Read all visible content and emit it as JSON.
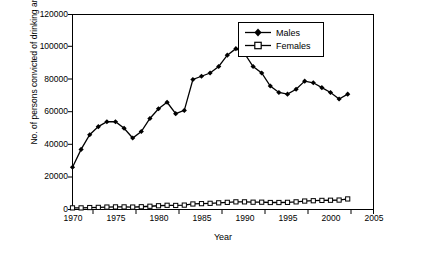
{
  "chart_data": {
    "type": "line",
    "title": "",
    "xlabel": "Year",
    "ylabel": "No. of persons convicted of drinking and driving",
    "xlim": [
      1970,
      2005
    ],
    "ylim": [
      0,
      120000
    ],
    "xticks": [
      1970,
      1975,
      1980,
      1985,
      1990,
      1995,
      2000,
      2005
    ],
    "yticks": [
      0,
      20000,
      40000,
      60000,
      80000,
      100000,
      120000
    ],
    "grid": false,
    "legend_position": "top-right-inside",
    "x": [
      1970,
      1971,
      1972,
      1973,
      1974,
      1975,
      1976,
      1977,
      1978,
      1979,
      1980,
      1981,
      1982,
      1983,
      1984,
      1985,
      1986,
      1987,
      1988,
      1989,
      1990,
      1991,
      1992,
      1993,
      1994,
      1995,
      1996,
      1997,
      1998,
      1999,
      2000,
      2001,
      2002
    ],
    "series": [
      {
        "name": "Males",
        "marker": "diamond",
        "values": [
          26000,
          37000,
          46000,
          51000,
          54000,
          54000,
          50000,
          44000,
          48000,
          56000,
          62000,
          66000,
          59000,
          61000,
          80000,
          82000,
          84000,
          88000,
          95000,
          99000,
          96000,
          88000,
          84000,
          76000,
          72000,
          71000,
          74000,
          79000,
          78000,
          75000,
          72000,
          68000,
          71000
        ]
      },
      {
        "name": "Females",
        "marker": "square",
        "values": [
          1000,
          1000,
          1200,
          1300,
          1500,
          1600,
          1600,
          1500,
          1700,
          2000,
          2300,
          2600,
          2500,
          2700,
          3400,
          3600,
          3800,
          4100,
          4400,
          4700,
          4700,
          4500,
          4500,
          4300,
          4300,
          4400,
          4700,
          5200,
          5400,
          5600,
          5700,
          5800,
          6500
        ]
      }
    ]
  },
  "legend": {
    "items": [
      {
        "label": "Males"
      },
      {
        "label": "Females"
      }
    ]
  },
  "axis": {
    "x_title": "Year",
    "y_title": "No. of persons convicted of drinking and driving",
    "x_tick_labels": [
      "1970",
      "1975",
      "1980",
      "1985",
      "1990",
      "1995",
      "2000",
      "2005"
    ],
    "y_tick_labels": [
      "0",
      "20000",
      "40000",
      "60000",
      "80000",
      "100000",
      "120000"
    ]
  }
}
